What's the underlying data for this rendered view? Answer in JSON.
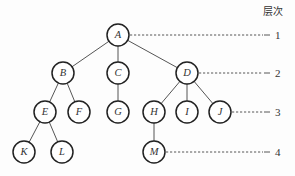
{
  "diagram": {
    "type": "tree",
    "header": "层次",
    "nodes": [
      {
        "id": "A",
        "label": "A",
        "level": 1,
        "x": 118,
        "y": 35
      },
      {
        "id": "B",
        "label": "B",
        "level": 2,
        "x": 63,
        "y": 73
      },
      {
        "id": "C",
        "label": "C",
        "level": 2,
        "x": 118,
        "y": 73
      },
      {
        "id": "D",
        "label": "D",
        "level": 2,
        "x": 187,
        "y": 73
      },
      {
        "id": "E",
        "label": "E",
        "level": 3,
        "x": 45,
        "y": 112
      },
      {
        "id": "F",
        "label": "F",
        "level": 3,
        "x": 79,
        "y": 112
      },
      {
        "id": "G",
        "label": "G",
        "level": 3,
        "x": 118,
        "y": 112
      },
      {
        "id": "H",
        "label": "H",
        "level": 3,
        "x": 154,
        "y": 112
      },
      {
        "id": "I",
        "label": "I",
        "level": 3,
        "x": 187,
        "y": 112
      },
      {
        "id": "J",
        "label": "J",
        "level": 3,
        "x": 220,
        "y": 112
      },
      {
        "id": "K",
        "label": "K",
        "level": 4,
        "x": 24,
        "y": 152
      },
      {
        "id": "L",
        "label": "L",
        "level": 4,
        "x": 62,
        "y": 152
      },
      {
        "id": "M",
        "label": "M",
        "level": 4,
        "x": 154,
        "y": 152
      }
    ],
    "edges": [
      [
        "A",
        "B"
      ],
      [
        "A",
        "C"
      ],
      [
        "A",
        "D"
      ],
      [
        "B",
        "E"
      ],
      [
        "B",
        "F"
      ],
      [
        "C",
        "G"
      ],
      [
        "D",
        "H"
      ],
      [
        "D",
        "I"
      ],
      [
        "D",
        "J"
      ],
      [
        "E",
        "K"
      ],
      [
        "E",
        "L"
      ],
      [
        "H",
        "M"
      ]
    ],
    "levels": [
      {
        "label": "1",
        "from_node": "A",
        "y": 35
      },
      {
        "label": "2",
        "from_node": "D",
        "y": 73
      },
      {
        "label": "3",
        "from_node": "J",
        "y": 112
      },
      {
        "label": "4",
        "from_node": "M",
        "y": 152
      }
    ],
    "style": {
      "node_radius": 11,
      "level_label_x": 275,
      "guide_end_x": 270
    }
  }
}
